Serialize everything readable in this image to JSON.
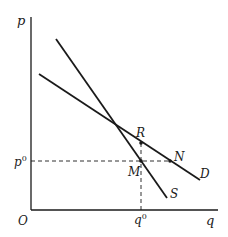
{
  "diagram": {
    "type": "supply-demand",
    "axes": {
      "y_label": "p",
      "x_label": "q",
      "origin_label": "O"
    },
    "reference_levels": {
      "price_label": "p",
      "price_superscript": "0",
      "quantity_label": "q",
      "quantity_superscript": "0"
    },
    "curves": [
      {
        "name": "D",
        "label": "D",
        "role": "demand"
      },
      {
        "name": "S",
        "label": "S",
        "role": "supply"
      }
    ],
    "points": [
      {
        "label": "R"
      },
      {
        "label": "M"
      },
      {
        "label": "N"
      }
    ],
    "colors": {
      "ink": "#1a1a1a",
      "background": "#ffffff"
    }
  }
}
